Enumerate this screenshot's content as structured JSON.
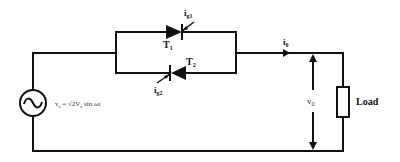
{
  "diagram": {
    "type": "single-phase AC voltage controller (anti-parallel thyristors)",
    "source": {
      "symbol": "ac-source",
      "formula": "v",
      "formula_sub": "s",
      "formula_eq": " = √2V",
      "formula_sub2": "s",
      "formula_tail": " sin ωt"
    },
    "thyristors": [
      {
        "label": "T",
        "sub": "1",
        "gate_label": "i",
        "gate_sub": "g1",
        "direction": "right"
      },
      {
        "label": "T",
        "sub": "2",
        "gate_label": "i",
        "gate_sub": "g2",
        "direction": "left"
      }
    ],
    "output_current": {
      "label": "i",
      "sub": "0"
    },
    "output_voltage": {
      "label": "v",
      "sub": "0"
    },
    "load": {
      "label": "Load"
    },
    "colors": {
      "line": "#111111",
      "background": "#ffffff"
    }
  }
}
